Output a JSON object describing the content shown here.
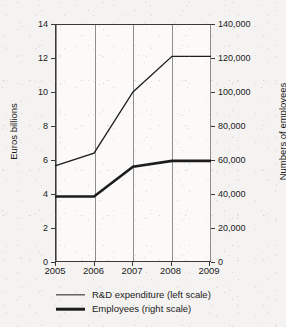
{
  "chart_data": {
    "type": "line",
    "title": "",
    "subtitle": "",
    "xlabel": "",
    "ylabel": "Euros billions",
    "y2label": "Numbers of employees",
    "categories": [
      "2005",
      "2006",
      "2007",
      "2008",
      "2009"
    ],
    "x": [
      2005,
      2006,
      2007,
      2008,
      2009
    ],
    "xlim": [
      2005,
      2009
    ],
    "ylim": [
      0,
      14
    ],
    "y2lim": [
      0,
      140000
    ],
    "yticks": [
      "0",
      "2",
      "4",
      "6",
      "8",
      "10",
      "12",
      "14"
    ],
    "ytick_values": [
      0,
      2,
      4,
      6,
      8,
      10,
      12,
      14
    ],
    "y2ticks": [
      "0",
      "20,000",
      "40,000",
      "60,000",
      "80,000",
      "100,000",
      "120,000",
      "140,000"
    ],
    "y2tick_values": [
      0,
      20000,
      40000,
      60000,
      80000,
      100000,
      120000,
      140000
    ],
    "grid": "vertical",
    "legend_position": "bottom",
    "series": [
      {
        "name": "R&D expenditure (left scale)",
        "axis": "left",
        "units": "Euros billions",
        "line_style": "thin",
        "color": "#1d1d1d",
        "values": [
          5.65,
          6.4,
          10.0,
          12.1,
          12.1
        ]
      },
      {
        "name": "Employees (right scale)",
        "axis": "right",
        "units": "Numbers of employees",
        "line_style": "thick",
        "color": "#1d1d1d",
        "values": [
          38500,
          38500,
          56000,
          59500,
          59500
        ]
      }
    ],
    "legend": [
      {
        "label": "R&D expenditure (left scale)",
        "style": "thin"
      },
      {
        "label": "Employees (right scale)",
        "style": "thick"
      }
    ]
  },
  "axes": {
    "left_title": "Euros billions",
    "right_title": "Numbers of employees",
    "left_ticks": [
      "14",
      "12",
      "10",
      "8",
      "6",
      "4",
      "2",
      "0"
    ],
    "right_ticks": [
      "140,000",
      "120,000",
      "100,000",
      "80,000",
      "60,000",
      "40,000",
      "20,000",
      "0"
    ],
    "x_ticks": [
      "2005",
      "2006",
      "2007",
      "2008",
      "2009"
    ]
  },
  "legend": {
    "rows": [
      {
        "label": "R&D expenditure (left scale)"
      },
      {
        "label": "Employees (right scale)"
      }
    ]
  },
  "colors": {
    "line": "#1d1d1d",
    "axis": "#3a3a3a",
    "grid": "#8e8e8e",
    "background": "#f4f3f1",
    "plot_background": "#fbfaf9"
  }
}
